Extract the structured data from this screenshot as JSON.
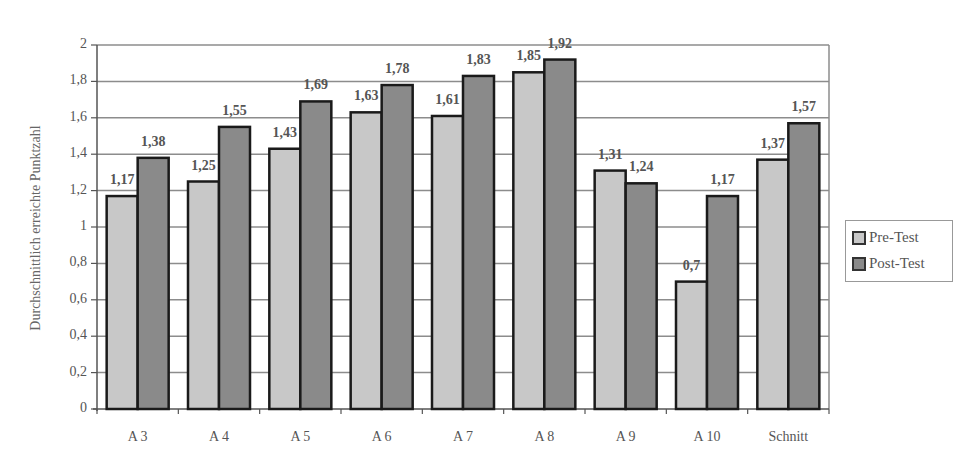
{
  "chart_data": {
    "type": "bar",
    "title": "",
    "xlabel": "",
    "ylabel": "Durchschnittlich erreichte Punktzahl",
    "categories": [
      "A 3",
      "A 4",
      "A 5",
      "A 6",
      "A 7",
      "A 8",
      "A 9",
      "A 10",
      "Schnitt"
    ],
    "series": [
      {
        "name": "Pre-Test",
        "values": [
          1.17,
          1.25,
          1.43,
          1.63,
          1.61,
          1.85,
          1.31,
          0.7,
          1.37
        ],
        "labels": [
          "1,17",
          "1,25",
          "1,43",
          "1,63",
          "1,61",
          "1,85",
          "1,31",
          "0,7",
          "1,37"
        ],
        "color": "#c8c8c8"
      },
      {
        "name": "Post-Test",
        "values": [
          1.38,
          1.55,
          1.69,
          1.78,
          1.83,
          1.92,
          1.24,
          1.17,
          1.57
        ],
        "labels": [
          "1,38",
          "1,55",
          "1,69",
          "1,78",
          "1,83",
          "1,92",
          "1,24",
          "1,17",
          "1,57"
        ],
        "color": "#8a8a8a"
      }
    ],
    "ylim": [
      0,
      2
    ],
    "yticks": [
      0,
      0.2,
      0.4,
      0.6,
      0.8,
      1,
      1.2,
      1.4,
      1.6,
      1.8,
      2
    ],
    "ytick_labels": [
      "0",
      "0,2",
      "0,4",
      "0,6",
      "0,8",
      "1",
      "1,2",
      "1,4",
      "1,6",
      "1,8",
      "2"
    ],
    "grid": true,
    "legend_position": "right"
  },
  "legend": {
    "items": [
      {
        "label": "Pre-Test",
        "color": "#c8c8c8"
      },
      {
        "label": "Post-Test",
        "color": "#8a8a8a"
      }
    ]
  },
  "axis": {
    "ylabel": "Durchschnittlich erreichte Punktzahl"
  }
}
